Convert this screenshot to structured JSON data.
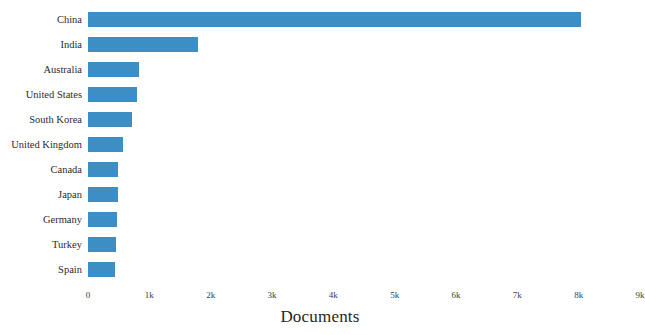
{
  "chart_data": {
    "type": "bar",
    "orientation": "horizontal",
    "title": "",
    "xlabel": "Documents",
    "ylabel": "",
    "categories": [
      "China",
      "India",
      "Australia",
      "United States",
      "South Korea",
      "United Kingdom",
      "Canada",
      "Japan",
      "Germany",
      "Turkey",
      "Spain"
    ],
    "values": [
      8030,
      1800,
      830,
      800,
      720,
      570,
      490,
      485,
      480,
      450,
      445
    ],
    "xlim": [
      0,
      9000
    ],
    "xticks": [
      0,
      1000,
      2000,
      3000,
      4000,
      5000,
      6000,
      7000,
      8000,
      9000
    ],
    "xticklabels": [
      "0",
      "1k",
      "2k",
      "3k",
      "4k",
      "5k",
      "6k",
      "7k",
      "8k",
      "9k"
    ],
    "grid": false,
    "legend": null,
    "bar_color": "#3d8ec4",
    "background_color": "#ffffff"
  }
}
